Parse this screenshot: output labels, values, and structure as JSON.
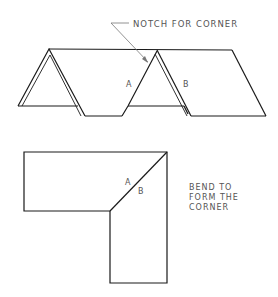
{
  "figure": {
    "top_view": {
      "callout": "NOTCH FOR CORNER",
      "label_a": "A",
      "label_b": "B"
    },
    "bottom_view": {
      "label_a": "A",
      "label_b": "B",
      "note_lines": [
        "BEND TO",
        "FORM THE",
        "CORNER"
      ]
    }
  },
  "colors": {
    "line": "#1a1a1a",
    "text": "#555555",
    "background": "#ffffff"
  }
}
